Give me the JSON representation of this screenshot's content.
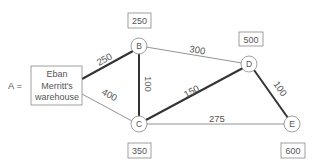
{
  "diagram": {
    "source": {
      "prefix": "A =",
      "lines": [
        "Eban",
        "Merritt's",
        "warehouse"
      ]
    },
    "nodes": [
      {
        "id": "B",
        "label": "B",
        "value": "250"
      },
      {
        "id": "C",
        "label": "C",
        "value": "350"
      },
      {
        "id": "D",
        "label": "D",
        "value": "500"
      },
      {
        "id": "E",
        "label": "E",
        "value": "600"
      }
    ],
    "edges": [
      {
        "from": "A",
        "to": "B",
        "weight": "250",
        "bold": true
      },
      {
        "from": "A",
        "to": "C",
        "weight": "400",
        "bold": false
      },
      {
        "from": "B",
        "to": "C",
        "weight": "100",
        "bold": true
      },
      {
        "from": "B",
        "to": "D",
        "weight": "300",
        "bold": false
      },
      {
        "from": "C",
        "to": "D",
        "weight": "150",
        "bold": true
      },
      {
        "from": "C",
        "to": "E",
        "weight": "275",
        "bold": false
      },
      {
        "from": "D",
        "to": "E",
        "weight": "100",
        "bold": true
      }
    ]
  }
}
